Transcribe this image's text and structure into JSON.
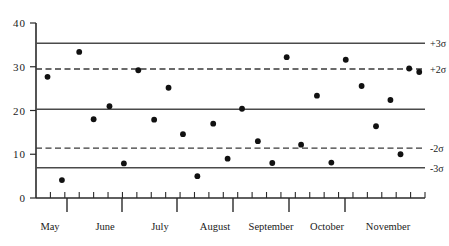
{
  "chart_data": {
    "type": "scatter",
    "title": "",
    "subtitle": "",
    "xlabel": "",
    "ylabel": "",
    "xlim": [
      0,
      27
    ],
    "ylim": [
      0,
      40
    ],
    "grid": false,
    "legend": null,
    "y_ticks": [
      0,
      10,
      20,
      30,
      40
    ],
    "y_tick_labels": [
      "0",
      "10",
      "20",
      "30",
      "40"
    ],
    "x_tick_labels": [
      "May",
      "June",
      "July",
      "August",
      "September",
      "October",
      "November"
    ],
    "x_month_centers": [
      50,
      105,
      160,
      215,
      271,
      327,
      388
    ],
    "x_month_boundaries": [
      67,
      122,
      177,
      233,
      289,
      345
    ],
    "x_minor_tick_count": 27,
    "annotations": [
      {
        "text": "+3σ",
        "value": 35.4
      },
      {
        "text": "+2σ",
        "value": 29.5
      },
      {
        "text": "-2σ",
        "value": 11.4
      },
      {
        "text": "-3σ",
        "value": 6.9
      }
    ],
    "control_lines": [
      {
        "name": "+3sigma",
        "value": 35.4,
        "style": "solid",
        "labeled": true,
        "label": "+3σ"
      },
      {
        "name": "+2sigma",
        "value": 29.5,
        "style": "dashed",
        "labeled": true,
        "label": "+2σ"
      },
      {
        "name": "center",
        "value": 20.3,
        "style": "solid",
        "labeled": false,
        "label": ""
      },
      {
        "name": "-2sigma",
        "value": 11.4,
        "style": "dashed",
        "labeled": true,
        "label": "-2σ"
      },
      {
        "name": "-3sigma",
        "value": 6.9,
        "style": "solid",
        "labeled": true,
        "label": "-3σ"
      }
    ],
    "points": [
      {
        "x": 0.8,
        "y": 27.7
      },
      {
        "x": 1.8,
        "y": 4.1
      },
      {
        "x": 3.0,
        "y": 33.4
      },
      {
        "x": 4.0,
        "y": 18.0
      },
      {
        "x": 5.1,
        "y": 21.0
      },
      {
        "x": 6.1,
        "y": 7.9
      },
      {
        "x": 7.1,
        "y": 29.2
      },
      {
        "x": 8.2,
        "y": 17.9
      },
      {
        "x": 9.2,
        "y": 25.2
      },
      {
        "x": 10.2,
        "y": 14.6
      },
      {
        "x": 11.2,
        "y": 5.0
      },
      {
        "x": 12.3,
        "y": 17.0
      },
      {
        "x": 13.3,
        "y": 9.0
      },
      {
        "x": 14.3,
        "y": 20.4
      },
      {
        "x": 15.4,
        "y": 13.0
      },
      {
        "x": 16.4,
        "y": 8.0
      },
      {
        "x": 17.4,
        "y": 32.2
      },
      {
        "x": 18.4,
        "y": 12.2
      },
      {
        "x": 19.5,
        "y": 23.4
      },
      {
        "x": 20.5,
        "y": 8.1
      },
      {
        "x": 21.5,
        "y": 31.6
      },
      {
        "x": 22.6,
        "y": 25.6
      },
      {
        "x": 23.6,
        "y": 16.4
      },
      {
        "x": 24.6,
        "y": 22.4
      },
      {
        "x": 25.3,
        "y": 10.0
      },
      {
        "x": 25.9,
        "y": 29.6
      },
      {
        "x": 26.6,
        "y": 28.8
      }
    ]
  }
}
